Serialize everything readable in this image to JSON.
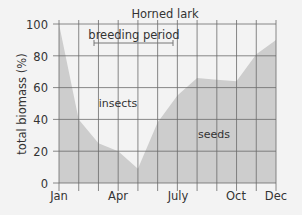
{
  "chart_data": {
    "type": "area",
    "title": "Horned lark",
    "xlabel": "",
    "ylabel": "total biomass (%)",
    "ylim": [
      0,
      100
    ],
    "yticks": [
      0,
      20,
      40,
      60,
      80,
      100
    ],
    "categories": [
      "Jan",
      "Feb",
      "Mar",
      "Apr",
      "May",
      "Jun",
      "July",
      "Aug",
      "Sep",
      "Oct",
      "Nov",
      "Dec"
    ],
    "xtick_labels": {
      "Jan": "Jan",
      "Apr": "Apr",
      "July": "July",
      "Oct": "Oct",
      "Dec": "Dec"
    },
    "series": [
      {
        "name": "seeds",
        "values": [
          100,
          40,
          25,
          20,
          9,
          38,
          55,
          66,
          65,
          64,
          81,
          90
        ]
      },
      {
        "name": "insects",
        "values": [
          0,
          60,
          75,
          80,
          91,
          62,
          45,
          34,
          35,
          36,
          19,
          10
        ]
      }
    ],
    "annotations": [
      {
        "text": "breeding period",
        "x_start": "Mar",
        "x_end": "Jun/July",
        "type": "range-bar"
      },
      {
        "text": "insects",
        "region": "upper"
      },
      {
        "text": "seeds",
        "region": "lower"
      }
    ],
    "grid": true,
    "colors": {
      "fill": "#cdcdcd",
      "background": "#f3f3f3",
      "grid": "#6b6b6b",
      "text": "#333333"
    }
  },
  "labels": {
    "title": "Horned lark",
    "ylabel": "total biomass (%)",
    "breeding": "breeding period",
    "insects": "insects",
    "seeds": "seeds",
    "y0": "0",
    "y20": "20",
    "y40": "40",
    "y60": "60",
    "y80": "80",
    "y100": "100",
    "xJan": "Jan",
    "xApr": "Apr",
    "xJuly": "July",
    "xOct": "Oct",
    "xDec": "Dec"
  }
}
